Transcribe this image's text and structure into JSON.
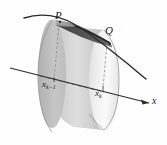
{
  "figure": {
    "background_color": "#fefefe",
    "labels": {
      "point_p": "P",
      "point_q": "Q",
      "partition_left": "x",
      "partition_left_sub": "k−1",
      "partition_right": "x",
      "partition_right_sub": "k",
      "axis": "x"
    },
    "colors": {
      "curve": "#2b2b2b",
      "axis": "#2b2b2b",
      "band_dark": "#4a4a4a",
      "cylinder_body_light": "#f2f2f2",
      "cylinder_body_mid": "#c9c9c9",
      "cylinder_body_dark": "#9a9a9a",
      "front_face_light": "#f7f7f7",
      "dashed_line": "#8a8a8a",
      "label_text": "#1a1a1a"
    },
    "geometry": {
      "back_ellipse_center_x": 52,
      "back_ellipse_center_y": 74,
      "back_ellipse_rx": 14,
      "back_ellipse_ry": 54,
      "front_ellipse_center_x": 104,
      "front_ellipse_center_y": 80,
      "front_ellipse_rx": 15,
      "front_ellipse_ry": 50,
      "axis_start_x": 10,
      "axis_start_y": 68,
      "axis_end_x": 149,
      "axis_end_y": 103,
      "curve_start_x": 24,
      "curve_start_y": 18,
      "curve_end_x": 146,
      "curve_end_y": 79
    }
  }
}
